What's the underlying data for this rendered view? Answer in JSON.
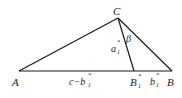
{
  "diagram": {
    "type": "triangle",
    "points": {
      "A": {
        "label": "A",
        "x": 19,
        "y": 71
      },
      "B": {
        "label": "B",
        "x": 172,
        "y": 71
      },
      "C": {
        "label": "C",
        "x": 118,
        "y": 18
      },
      "B1": {
        "label": "B",
        "x": 134,
        "y": 71
      }
    },
    "labels": {
      "A": "A",
      "B": "B",
      "C": "C",
      "B1_main": "B",
      "B1_sup": "*",
      "B1_sub": "1",
      "a1_main": "a",
      "a1_sup": "*",
      "a1_sub": "1",
      "beta": "β",
      "b1_main": "b",
      "b1_sup": "*",
      "b1_sub": "1",
      "c_minus_b1_main": "c−b",
      "c_minus_b1_sup": "*",
      "c_minus_b1_sub": "1"
    },
    "colors": {
      "line": "#1a1a1a",
      "text": "#222222",
      "background": "#ffffff"
    }
  }
}
